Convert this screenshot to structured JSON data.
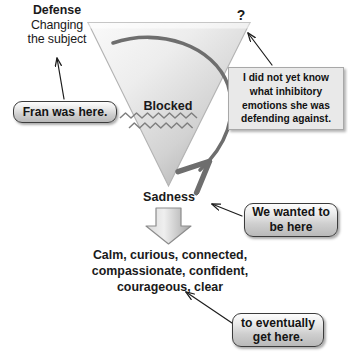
{
  "diagram": {
    "title_labels": {
      "defense": "Defense",
      "defense_detail": "Changing\nthe subject",
      "question_mark": "?",
      "blocked": "Blocked",
      "sadness": "Sadness",
      "outcome": "Calm, curious, connected,\ncompassionate, confident,\ncourageous, clear"
    },
    "callouts": {
      "fran": "Fran was here.",
      "inhibitory": "I did not yet know what inhibitory emotions she was defending against.",
      "wanted": "We wanted to\nbe here",
      "eventually": "to eventually\nget here."
    },
    "colors": {
      "background": "#ffffff",
      "text": "#1a1a1a",
      "funnel_fill_light": "#f3f3f3",
      "funnel_fill_dark": "#b4b4b4",
      "funnel_stroke": "#9a9a9a",
      "curved_arrow": "#6e6e6e",
      "pointer_line": "#1d1d1d",
      "pill_border": "#3c3c3c",
      "box_fill": "#e9e9e9",
      "box_border": "#a8a8a8",
      "block_arrow_fill": "#c6c6c6"
    },
    "shapes": {
      "funnel_name": "inverted-triangle-funnel",
      "blocked_zigzag_count": 2,
      "curved_arrow_direction": "clockwise-around-funnel",
      "block_arrow_direction": "down"
    }
  }
}
